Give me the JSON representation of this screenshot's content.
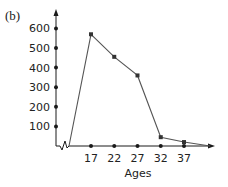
{
  "panel_label": "(b)",
  "chart_data": {
    "type": "line",
    "title": "",
    "xlabel": "Ages",
    "ylabel": "",
    "categories": [
      17,
      22,
      27,
      32,
      37
    ],
    "x": [
      17,
      22,
      27,
      32,
      37
    ],
    "values": [
      570,
      455,
      360,
      45,
      20
    ],
    "x_ticks": [
      "17",
      "22",
      "27",
      "32",
      "37"
    ],
    "y_ticks": [
      "100",
      "200",
      "300",
      "400",
      "500",
      "600"
    ],
    "ylim": [
      0,
      600
    ],
    "axis_break": "zigzag on x-axis near origin",
    "grid": false,
    "legend": null,
    "line_continues_to_x_axis_after_last_point": true
  }
}
